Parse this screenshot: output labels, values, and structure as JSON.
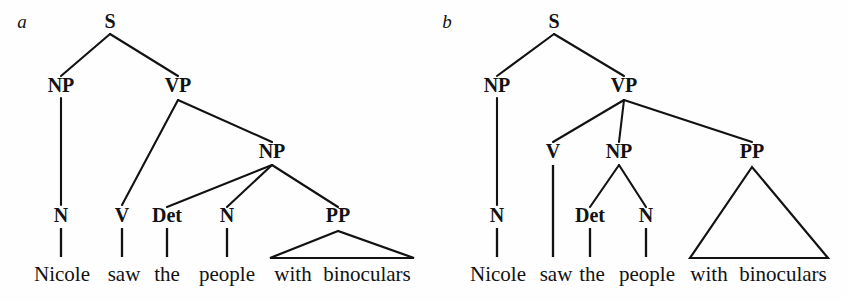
{
  "figure": {
    "background_color": "#fefefe",
    "ink_color": "#121212",
    "width": 847,
    "height": 302,
    "type": "syntax-tree-pair"
  },
  "panels": [
    {
      "id": "a",
      "letter": "a",
      "letter_pos": {
        "x": 22,
        "y": 28
      },
      "reading": "PP attaches to NP (the people with binoculars)",
      "nodes": [
        {
          "name": "s",
          "label": "S",
          "x": 110,
          "y": 28
        },
        {
          "name": "np-subj",
          "label": "NP",
          "x": 61,
          "y": 92
        },
        {
          "name": "vp",
          "label": "VP",
          "x": 178,
          "y": 92
        },
        {
          "name": "np-obj",
          "label": "NP",
          "x": 272,
          "y": 158
        },
        {
          "name": "n-subj",
          "label": "N",
          "x": 61,
          "y": 222
        },
        {
          "name": "v",
          "label": "V",
          "x": 122,
          "y": 222
        },
        {
          "name": "det",
          "label": "Det",
          "x": 167,
          "y": 222
        },
        {
          "name": "n-obj",
          "label": "N",
          "x": 227,
          "y": 222
        },
        {
          "name": "pp",
          "label": "PP",
          "x": 338,
          "y": 222
        }
      ],
      "branches": [
        {
          "name": "s-to-np",
          "x1": 110,
          "y1": 34,
          "x2": 61,
          "y2": 76
        },
        {
          "name": "s-to-vp",
          "x1": 110,
          "y1": 34,
          "x2": 178,
          "y2": 76
        },
        {
          "name": "np-to-n",
          "x1": 61,
          "y1": 98,
          "x2": 61,
          "y2": 205
        },
        {
          "name": "vp-to-v",
          "x1": 178,
          "y1": 100,
          "x2": 122,
          "y2": 205
        },
        {
          "name": "vp-to-np",
          "x1": 178,
          "y1": 100,
          "x2": 272,
          "y2": 142
        },
        {
          "name": "np-to-det",
          "x1": 272,
          "y1": 165,
          "x2": 167,
          "y2": 207
        },
        {
          "name": "np-to-nobj",
          "x1": 272,
          "y1": 165,
          "x2": 227,
          "y2": 207
        },
        {
          "name": "np-to-pp",
          "x1": 272,
          "y1": 165,
          "x2": 338,
          "y2": 207
        }
      ],
      "stems": [
        {
          "name": "stem-nicole",
          "x": 61,
          "y1": 228,
          "y2": 257
        },
        {
          "name": "stem-saw",
          "x": 122,
          "y1": 228,
          "y2": 257
        },
        {
          "name": "stem-the",
          "x": 167,
          "y1": 228,
          "y2": 257
        },
        {
          "name": "stem-people",
          "x": 227,
          "y1": 228,
          "y2": 257
        }
      ],
      "triangle": {
        "name": "pp-triangle",
        "apex_x": 338,
        "apex_y": 231,
        "left_x": 270,
        "right_x": 414,
        "base_y": 258
      },
      "words": [
        {
          "name": "word-nicole",
          "text": "Nicole",
          "x": 62,
          "y": 281
        },
        {
          "name": "word-saw",
          "text": "saw",
          "x": 124,
          "y": 281
        },
        {
          "name": "word-the",
          "text": "the",
          "x": 167,
          "y": 281
        },
        {
          "name": "word-people",
          "text": "people",
          "x": 227,
          "y": 281
        },
        {
          "name": "word-with",
          "text": "with",
          "x": 293,
          "y": 281
        },
        {
          "name": "word-binoculars",
          "text": "binoculars",
          "x": 367,
          "y": 281
        }
      ]
    },
    {
      "id": "b",
      "letter": "b",
      "letter_pos": {
        "x": 447,
        "y": 28
      },
      "reading": "PP attaches to VP (saw with binoculars)",
      "nodes": [
        {
          "name": "s",
          "label": "S",
          "x": 554,
          "y": 28
        },
        {
          "name": "np-subj",
          "label": "NP",
          "x": 497,
          "y": 92
        },
        {
          "name": "vp",
          "label": "VP",
          "x": 624,
          "y": 92
        },
        {
          "name": "v",
          "label": "V",
          "x": 553,
          "y": 158
        },
        {
          "name": "np-obj",
          "label": "NP",
          "x": 619,
          "y": 158
        },
        {
          "name": "pp",
          "label": "PP",
          "x": 752,
          "y": 158
        },
        {
          "name": "n-subj",
          "label": "N",
          "x": 497,
          "y": 222
        },
        {
          "name": "det",
          "label": "Det",
          "x": 590,
          "y": 222
        },
        {
          "name": "n-obj",
          "label": "N",
          "x": 646,
          "y": 222
        }
      ],
      "branches": [
        {
          "name": "s-to-np",
          "x1": 554,
          "y1": 34,
          "x2": 497,
          "y2": 76
        },
        {
          "name": "s-to-vp",
          "x1": 554,
          "y1": 34,
          "x2": 624,
          "y2": 76
        },
        {
          "name": "np-to-n",
          "x1": 497,
          "y1": 98,
          "x2": 497,
          "y2": 205
        },
        {
          "name": "vp-to-v",
          "x1": 624,
          "y1": 100,
          "x2": 553,
          "y2": 142
        },
        {
          "name": "vp-to-np",
          "x1": 624,
          "y1": 100,
          "x2": 619,
          "y2": 142
        },
        {
          "name": "vp-to-pp",
          "x1": 624,
          "y1": 100,
          "x2": 752,
          "y2": 142
        },
        {
          "name": "np-to-det",
          "x1": 619,
          "y1": 165,
          "x2": 590,
          "y2": 207
        },
        {
          "name": "np-to-nobj",
          "x1": 619,
          "y1": 165,
          "x2": 646,
          "y2": 207
        }
      ],
      "stems": [
        {
          "name": "stem-nicole",
          "x": 497,
          "y1": 228,
          "y2": 257
        },
        {
          "name": "stem-saw",
          "x": 553,
          "y1": 165,
          "y2": 257
        },
        {
          "name": "stem-the",
          "x": 590,
          "y1": 228,
          "y2": 257
        },
        {
          "name": "stem-people",
          "x": 646,
          "y1": 228,
          "y2": 257
        }
      ],
      "triangle": {
        "name": "pp-triangle",
        "apex_x": 752,
        "apex_y": 167,
        "left_x": 690,
        "right_x": 828,
        "base_y": 258
      },
      "words": [
        {
          "name": "word-nicole",
          "text": "Nicole",
          "x": 498,
          "y": 281
        },
        {
          "name": "word-saw",
          "text": "saw",
          "x": 556,
          "y": 281
        },
        {
          "name": "word-the",
          "text": "the",
          "x": 592,
          "y": 281
        },
        {
          "name": "word-people",
          "text": "people",
          "x": 647,
          "y": 281
        },
        {
          "name": "word-with",
          "text": "with",
          "x": 709,
          "y": 281
        },
        {
          "name": "word-binoculars",
          "text": "binoculars",
          "x": 783,
          "y": 281
        }
      ]
    }
  ]
}
